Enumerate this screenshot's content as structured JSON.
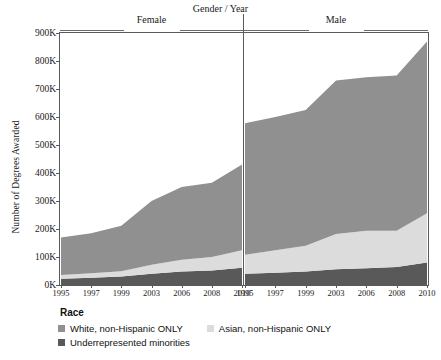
{
  "chart_data": {
    "type": "area",
    "title": "",
    "facet_title": "Gender / Year",
    "ylabel": "Number of Degrees Awarded",
    "xlabel": "",
    "stacked": true,
    "grid": false,
    "legend_position": "bottom-left",
    "legend_title": "Race",
    "ylim": [
      0,
      900000
    ],
    "yticks": [
      0,
      100000,
      200000,
      300000,
      400000,
      500000,
      600000,
      700000,
      800000,
      900000
    ],
    "ytick_labels": [
      "0K",
      "100K",
      "200K",
      "300K",
      "400K",
      "500K",
      "600K",
      "700K",
      "800K",
      "900K"
    ],
    "categories": [
      "1995",
      "1997",
      "1999",
      "2003",
      "2006",
      "2008",
      "2010"
    ],
    "facets": [
      {
        "name": "Female",
        "x": [
          "1995",
          "1997",
          "1999",
          "2003",
          "2006",
          "2008",
          "2010"
        ],
        "series": [
          {
            "name": "Underrepresented minorities",
            "color": "#595959",
            "values": [
              22000,
              26000,
              30000,
              40000,
              48000,
              52000,
              62000
            ]
          },
          {
            "name": "Asian, non-Hispanic ONLY",
            "color": "#dcdcdc",
            "values": [
              14000,
              16000,
              19000,
              32000,
              42000,
              48000,
              62000
            ]
          },
          {
            "name": "White, non-Hispanic ONLY",
            "color": "#909090",
            "values": [
              134000,
              143000,
              163000,
              228000,
              260000,
              265000,
              306000
            ]
          }
        ],
        "totals": [
          170000,
          185000,
          212000,
          300000,
          350000,
          365000,
          430000
        ]
      },
      {
        "name": "Male",
        "x": [
          "1995",
          "1997",
          "1999",
          "2003",
          "2006",
          "2008",
          "2010"
        ],
        "series": [
          {
            "name": "Underrepresented minorities",
            "color": "#595959",
            "values": [
              40000,
              44000,
              48000,
              56000,
              60000,
              64000,
              80000
            ]
          },
          {
            "name": "Asian, non-Hispanic ONLY",
            "color": "#dcdcdc",
            "values": [
              68000,
              80000,
              92000,
              126000,
              134000,
              130000,
              176000
            ]
          },
          {
            "name": "White, non-Hispanic ONLY",
            "color": "#909090",
            "values": [
              470000,
              476000,
              485000,
              548000,
              548000,
              554000,
              614000
            ]
          }
        ],
        "totals": [
          578000,
          600000,
          625000,
          730000,
          742000,
          748000,
          870000
        ]
      }
    ],
    "legend_entries": [
      {
        "label": "White, non-Hispanic ONLY",
        "color": "#909090"
      },
      {
        "label": "Asian, non-Hispanic ONLY",
        "color": "#dcdcdc"
      },
      {
        "label": "Underrepresented minorities",
        "color": "#595959"
      }
    ]
  }
}
